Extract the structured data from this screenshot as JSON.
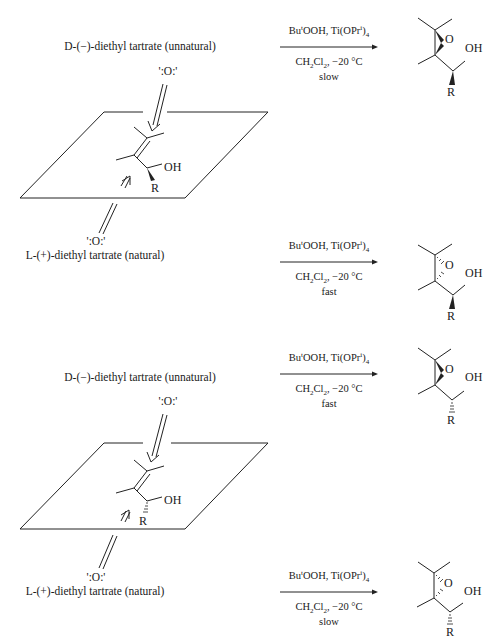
{
  "panels": [
    {
      "id": "top",
      "substrate_R_bond": "wedge",
      "top_face": {
        "tartrate_label": "D-(−)-diethyl tartrate (unnatural)",
        "oxygen_label": "':O:'",
        "reagents_top": {
          "a": "Bu",
          "a_sup": "t",
          "b": "OOH, Ti(OPr",
          "b_sup": "i",
          "c": ")",
          "c_sub": "4"
        },
        "conditions": {
          "a": "CH",
          "a_sub": "2",
          "b": "Cl",
          "b_sub": "2",
          "c": ", −20 °C"
        },
        "rate": "slow",
        "product_epoxide_bond": "wedge",
        "product_R_bond": "wedge"
      },
      "bottom_face": {
        "tartrate_label": "L-(+)-diethyl tartrate (natural)",
        "oxygen_label": "':O:'",
        "reagents_top": {
          "a": "Bu",
          "a_sup": "t",
          "b": "OOH, Ti(OPr",
          "b_sup": "i",
          "c": ")",
          "c_sub": "4"
        },
        "conditions": {
          "a": "CH",
          "a_sub": "2",
          "b": "Cl",
          "b_sub": "2",
          "c": ", −20 °C"
        },
        "rate": "fast",
        "product_epoxide_bond": "hash",
        "product_R_bond": "wedge"
      }
    },
    {
      "id": "bottom",
      "substrate_R_bond": "hash",
      "top_face": {
        "tartrate_label": "D-(−)-diethyl tartrate (unnatural)",
        "oxygen_label": "':O:'",
        "reagents_top": {
          "a": "Bu",
          "a_sup": "t",
          "b": "OOH, Ti(OPr",
          "b_sup": "i",
          "c": ")",
          "c_sub": "4"
        },
        "conditions": {
          "a": "CH",
          "a_sub": "2",
          "b": "Cl",
          "b_sub": "2",
          "c": ", −20 °C"
        },
        "rate": "fast",
        "product_epoxide_bond": "wedge",
        "product_R_bond": "hash"
      },
      "bottom_face": {
        "tartrate_label": "L-(+)-diethyl tartrate (natural)",
        "oxygen_label": "':O:'",
        "reagents_top": {
          "a": "Bu",
          "a_sup": "t",
          "b": "OOH, Ti(OPr",
          "b_sup": "i",
          "c": ")",
          "c_sub": "4"
        },
        "conditions": {
          "a": "CH",
          "a_sub": "2",
          "b": "Cl",
          "b_sub": "2",
          "c": ", −20 °C"
        },
        "rate": "slow",
        "product_epoxide_bond": "hash",
        "product_R_bond": "hash"
      }
    }
  ],
  "atoms": {
    "O": "O",
    "OH": "OH",
    "R": "R"
  }
}
